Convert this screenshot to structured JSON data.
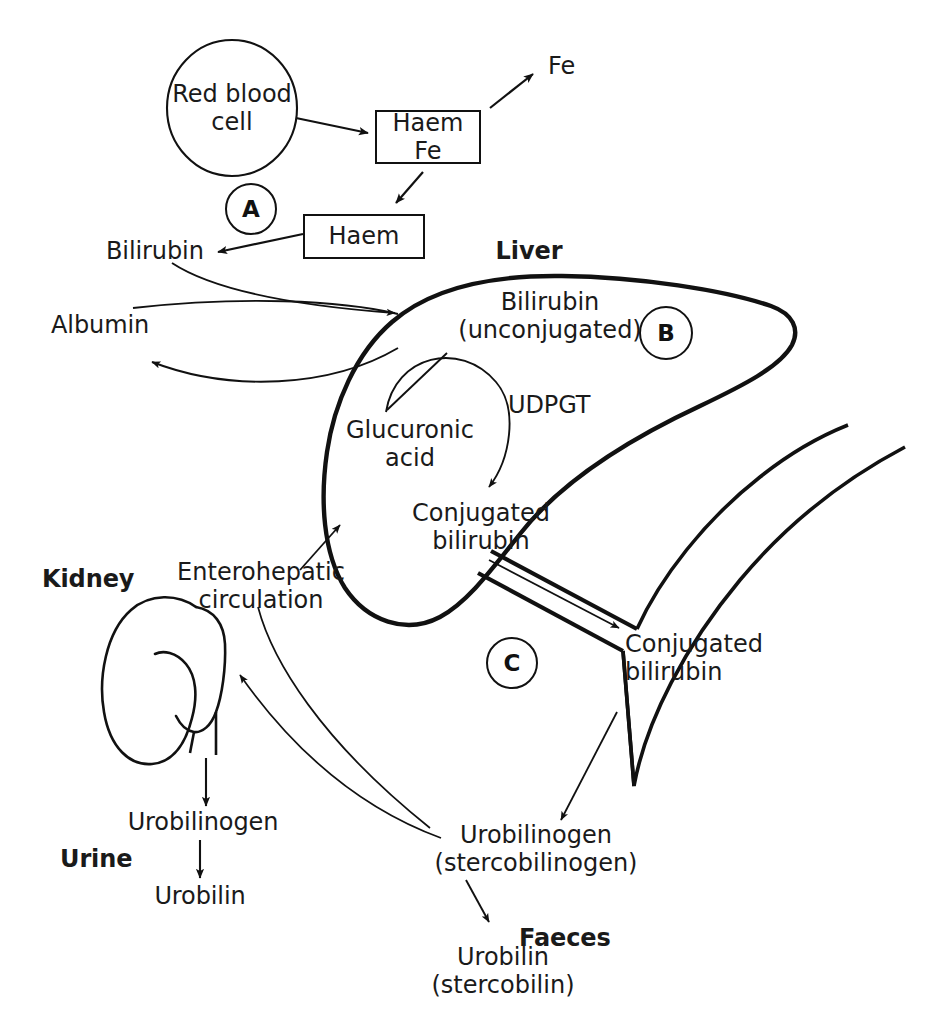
{
  "diagram": {
    "colors": {
      "stroke": "#111111",
      "text": "#1a1a1a",
      "background": "#ffffff"
    },
    "nodes": {
      "red_blood_cell": "Red blood\ncell",
      "red_blood_cell_line1": "Red blood",
      "red_blood_cell_line2": "cell",
      "haem_fe_line1": "Haem",
      "haem_fe_line2": "Fe",
      "fe": "Fe",
      "haem": "Haem",
      "bilirubin": "Bilirubin",
      "albumin": "Albumin",
      "liver": "Liver",
      "bilirubin_unconj_line1": "Bilirubin",
      "bilirubin_unconj_line2": "(unconjugated)",
      "udpgt": "UDPGT",
      "glucuronic_acid_line1": "Glucuronic",
      "glucuronic_acid_line2": "acid",
      "conjugated_bilirubin_liver_line1": "Conjugated",
      "conjugated_bilirubin_liver_line2": "bilirubin",
      "conjugated_bilirubin_gut_line1": "Conjugated",
      "conjugated_bilirubin_gut_line2": "bilirubin",
      "enterohepatic_line1": "Enterohepatic",
      "enterohepatic_line2": "circulation",
      "kidney": "Kidney",
      "urine": "Urine",
      "urobilinogen_kidney": "Urobilinogen",
      "urobilin_kidney": "Urobilin",
      "urobilinogen_gut_line1": "Urobilinogen",
      "urobilinogen_gut_line2": "(stercobilinogen)",
      "faeces": "Faeces",
      "urobilin_gut_line1": "Urobilin",
      "urobilin_gut_line2": "(stercobilin)"
    },
    "markers": [
      {
        "id": "A",
        "label": "A"
      },
      {
        "id": "B",
        "label": "B"
      },
      {
        "id": "C",
        "label": "C"
      }
    ]
  }
}
